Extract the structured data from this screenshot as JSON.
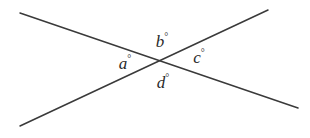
{
  "figure": {
    "name": "two-intersecting-lines-angle-diagram",
    "background_color": "#ffffff",
    "line_color": "#3a3a3a",
    "line_width": 1.5,
    "text_color": "#2a2a2a",
    "intersection": {
      "x": 161,
      "y": 62
    },
    "lines": [
      {
        "id": "line-falling",
        "description": "line descending from upper-left to lower-right",
        "x1": 20,
        "y1": 13,
        "x2": 298,
        "y2": 108
      },
      {
        "id": "line-rising",
        "description": "line rising from lower-left to upper-right",
        "x1": 20,
        "y1": 126,
        "x2": 268,
        "y2": 10
      }
    ],
    "labels": [
      {
        "id": "label-a",
        "letter": "a",
        "degree": "°",
        "x": 125,
        "y": 63,
        "position": "left"
      },
      {
        "id": "label-b",
        "letter": "b",
        "degree": "°",
        "x": 162,
        "y": 41,
        "position": "top"
      },
      {
        "id": "label-c",
        "letter": "c",
        "degree": "°",
        "x": 199,
        "y": 57,
        "position": "right"
      },
      {
        "id": "label-d",
        "letter": "d",
        "degree": "°",
        "x": 163,
        "y": 82,
        "position": "bottom"
      }
    ]
  }
}
